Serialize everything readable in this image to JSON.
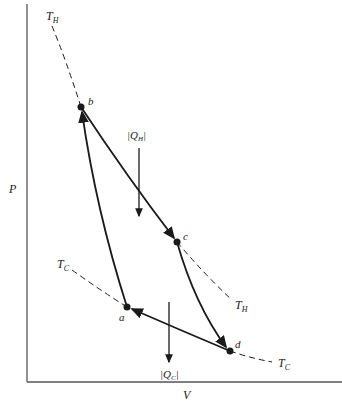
{
  "diagram": {
    "type": "pv-diagram-carnot-cycle",
    "axes": {
      "x_label": "V",
      "y_label": "P"
    },
    "points": [
      {
        "id": "a",
        "label": "a",
        "x": 127,
        "y": 307
      },
      {
        "id": "b",
        "label": "b",
        "x": 81,
        "y": 107
      },
      {
        "id": "c",
        "label": "c",
        "x": 177,
        "y": 242
      },
      {
        "id": "d",
        "label": "d",
        "x": 230,
        "y": 351
      }
    ],
    "isotherms": {
      "hot": {
        "label": "T",
        "sub": "H"
      },
      "cold": {
        "label": "T",
        "sub": "C"
      }
    },
    "heat_flows": {
      "hot": {
        "label": "|Q",
        "sub": "H",
        "close": "|"
      },
      "cold": {
        "label": "|Q",
        "sub": "C",
        "close": "|"
      }
    },
    "colors": {
      "line": "#1a1a1a",
      "axis": "#555555",
      "background": "#ffffff"
    }
  }
}
